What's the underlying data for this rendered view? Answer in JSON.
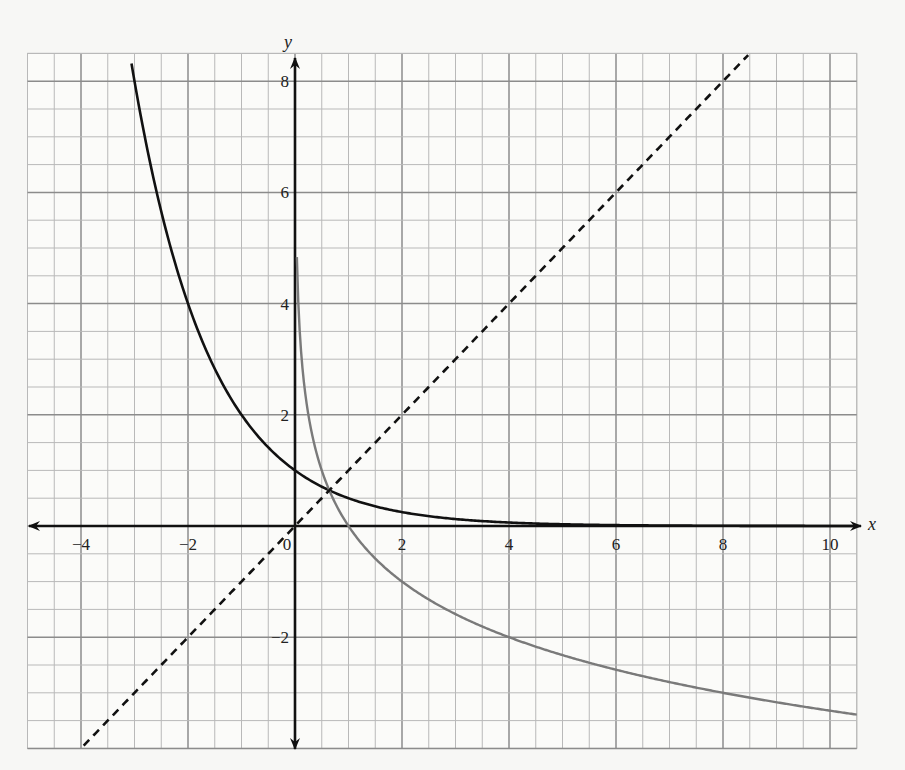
{
  "chart_data": {
    "type": "line",
    "title": "",
    "xlabel": "x",
    "ylabel": "y",
    "xlim": [
      -5,
      10.5
    ],
    "ylim": [
      -4,
      8.5
    ],
    "grid": true,
    "grid_minor_step": 0.5,
    "grid_major_step": 2,
    "x_ticks": [
      -4,
      -2,
      0,
      2,
      4,
      6,
      8,
      10
    ],
    "x_tick_labels": [
      "−4",
      "−2",
      "0",
      "2",
      "4",
      "6",
      "8",
      "10"
    ],
    "y_ticks": [
      -2,
      2,
      4,
      6,
      8
    ],
    "y_tick_labels": [
      "−2",
      "2",
      "4",
      "6",
      "8"
    ],
    "legend": null,
    "series": [
      {
        "name": "y = (1/2)^x",
        "style": "solid",
        "color": "#111111",
        "width": 2.6,
        "function": "exp_half",
        "x_range": [
          -3.09,
          10.5
        ],
        "points": [
          [
            -3,
            8
          ],
          [
            -2,
            4
          ],
          [
            -1,
            2
          ],
          [
            0,
            1
          ],
          [
            1,
            0.5
          ],
          [
            2,
            0.25
          ],
          [
            3,
            0.125
          ],
          [
            4,
            0.0625
          ],
          [
            6,
            0.016
          ],
          [
            8,
            0.004
          ],
          [
            10,
            0.001
          ]
        ]
      },
      {
        "name": "y = log_(1/2) x",
        "style": "solid",
        "color": "#7a7a7a",
        "width": 2.4,
        "function": "log_half",
        "x_range": [
          0.035,
          10.5
        ],
        "points": [
          [
            0.0625,
            4
          ],
          [
            0.125,
            3
          ],
          [
            0.25,
            2
          ],
          [
            0.5,
            1
          ],
          [
            1,
            0
          ],
          [
            2,
            -1
          ],
          [
            4,
            -2
          ],
          [
            8,
            -3
          ],
          [
            10.5,
            -3.39
          ]
        ]
      },
      {
        "name": "y = x",
        "style": "dashed",
        "color": "#111111",
        "width": 2.6,
        "function": "identity",
        "x_range": [
          -3.95,
          8.47
        ],
        "points": [
          [
            -4,
            -4
          ],
          [
            0,
            0
          ],
          [
            8.5,
            8.5
          ]
        ]
      }
    ]
  },
  "layout": {
    "origin_px": [
      295,
      526
    ],
    "px_per_unit_x": 53.5,
    "px_per_unit_y": 55.6,
    "colors": {
      "background": "#f7f7f5",
      "grid_minor": "#b9b9b9",
      "grid_major": "#8c8c8c",
      "axis": "#111111"
    }
  }
}
